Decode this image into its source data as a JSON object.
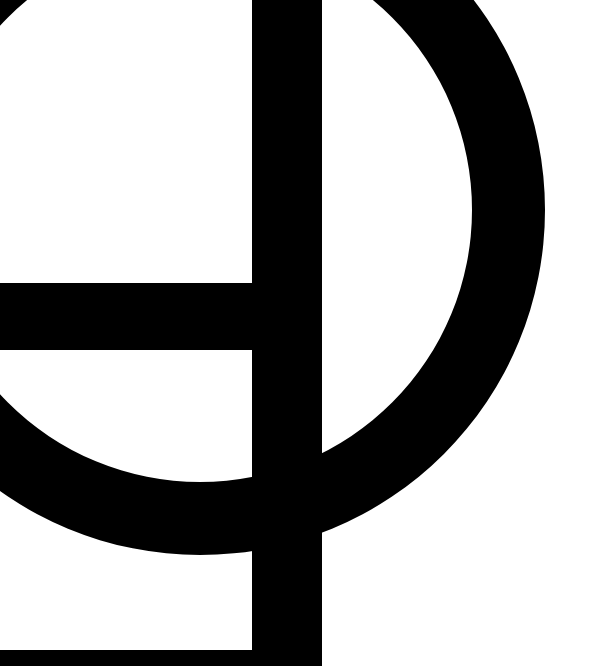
{
  "graphic": {
    "description": "Black geometric symbol: vertical bar, horizontal bar, and partial ring on white",
    "colors": {
      "background": "#ffffff",
      "ink": "#000000"
    }
  }
}
